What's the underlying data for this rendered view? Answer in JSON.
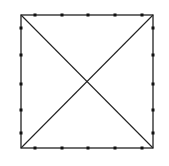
{
  "diagram": {
    "type": "square-with-diagonals",
    "stroke_color": "#222222",
    "marker_color": "#111111",
    "background": "#ffffff",
    "square": {
      "x1": 21,
      "y1": 15,
      "x2": 153,
      "y2": 148
    },
    "diagonals": [
      {
        "from": [
          21,
          15
        ],
        "to": [
          153,
          148
        ]
      },
      {
        "from": [
          153,
          15
        ],
        "to": [
          21,
          148
        ]
      }
    ],
    "markers": {
      "top": [
        35,
        62,
        88,
        115,
        142
      ],
      "bottom": [
        35,
        62,
        88,
        115,
        142
      ],
      "left": [
        28,
        55,
        84,
        110,
        133
      ],
      "right": [
        28,
        55,
        84,
        110,
        133
      ]
    },
    "markers_per_side": 5
  }
}
